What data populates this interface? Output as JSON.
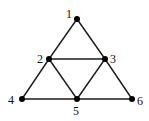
{
  "diagram": {
    "type": "graph",
    "colors": {
      "edge": "#1a1a1a",
      "node": "#000000",
      "label": "#111111",
      "background": "#ffffff"
    },
    "nodes": [
      {
        "id": "1",
        "label": "1",
        "x": 77,
        "y": 19,
        "lx": 66,
        "ly": 18
      },
      {
        "id": "2",
        "label": "2",
        "x": 49,
        "y": 59,
        "lx": 37,
        "ly": 63
      },
      {
        "id": "3",
        "label": "3",
        "x": 105,
        "y": 59,
        "lx": 110,
        "ly": 63
      },
      {
        "id": "4",
        "label": "4",
        "x": 22,
        "y": 99,
        "lx": 8,
        "ly": 104
      },
      {
        "id": "5",
        "label": "5",
        "x": 77,
        "y": 99,
        "lx": 73,
        "ly": 115
      },
      {
        "id": "6",
        "label": "6",
        "x": 132,
        "y": 99,
        "lx": 137,
        "ly": 105
      }
    ],
    "edges": [
      {
        "from": "1",
        "to": "2"
      },
      {
        "from": "1",
        "to": "3"
      },
      {
        "from": "2",
        "to": "3"
      },
      {
        "from": "2",
        "to": "4"
      },
      {
        "from": "2",
        "to": "5"
      },
      {
        "from": "3",
        "to": "5"
      },
      {
        "from": "3",
        "to": "6"
      },
      {
        "from": "4",
        "to": "5"
      },
      {
        "from": "5",
        "to": "6"
      }
    ]
  }
}
